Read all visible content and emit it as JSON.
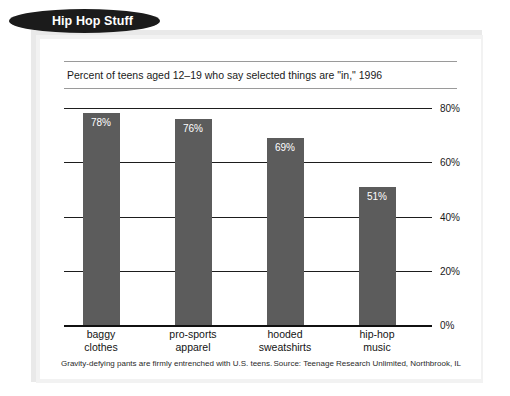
{
  "header": {
    "pill_title": "Hip Hop Stuff"
  },
  "chart_data": {
    "type": "bar",
    "title": "Hip Hop Stuff",
    "subtitle": "Percent of teens aged 12–19 who say selected things are \"in,\" 1996",
    "categories": [
      "baggy clothes",
      "pro-sports apparel",
      "hooded sweatshirts",
      "hip-hop music"
    ],
    "category_lines": [
      [
        "baggy",
        "clothes"
      ],
      [
        "pro-sports",
        "apparel"
      ],
      [
        "hooded",
        "sweatshirts"
      ],
      [
        "hip-hop",
        "music"
      ]
    ],
    "values": [
      78,
      76,
      69,
      51
    ],
    "value_labels": [
      "78%",
      "76%",
      "69%",
      "51%"
    ],
    "xlabel": "",
    "ylabel": "",
    "ylim": [
      0,
      80
    ],
    "yticks": [
      80,
      60,
      40,
      20,
      0
    ],
    "ytick_labels": [
      "80%",
      "60%",
      "40%",
      "20%",
      "0%"
    ],
    "grid": true,
    "legend": false,
    "bar_color": "#5c5c5c",
    "value_label_color": "#ffffff",
    "gridline_color": "#1d1d1d"
  },
  "footnote": {
    "caption": "Gravity-defying pants are firmly entrenched with U.S. teens.",
    "source": "Source: Teenage Research Unlimited, Northbrook, IL"
  }
}
